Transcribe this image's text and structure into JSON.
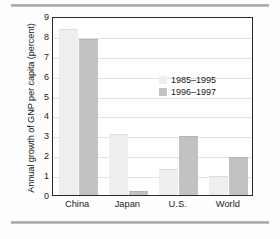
{
  "chart_data": {
    "type": "bar",
    "title": "",
    "xlabel": "",
    "ylabel": "Annual growth of GNP per capita (percent)",
    "categories": [
      "China",
      "Japan",
      "U.S.",
      "World"
    ],
    "series": [
      {
        "name": "1985–1995",
        "color": "#eeeeee",
        "values": [
          8.3,
          3.0,
          1.25,
          0.9
        ]
      },
      {
        "name": "1996–1997",
        "color": "#c2c2c2",
        "values": [
          7.8,
          0.15,
          2.9,
          1.85
        ]
      }
    ],
    "ylim": [
      0,
      9
    ],
    "yticks": [
      "0",
      "1",
      "2",
      "3",
      "4",
      "5",
      "6",
      "7",
      "8",
      "9"
    ],
    "grid": true,
    "legend_position": "inside-upper-right"
  },
  "legend": {
    "entries": [
      {
        "label": "1985–1995"
      },
      {
        "label": "1996–1997"
      }
    ]
  }
}
